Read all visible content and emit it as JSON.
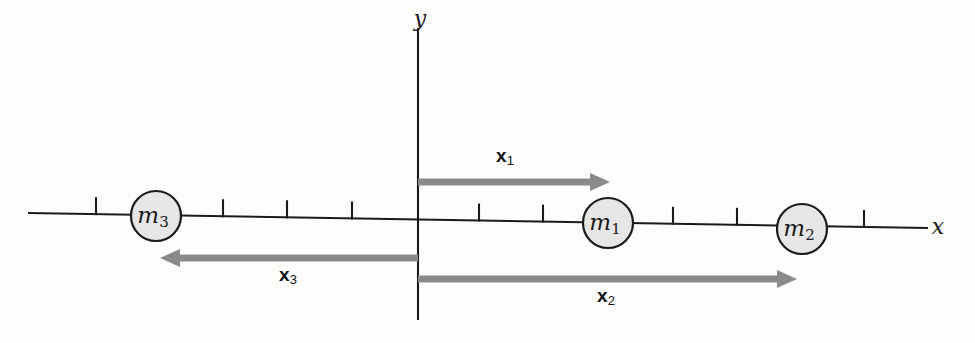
{
  "figure": {
    "background_color": "#fdfdfc",
    "axis_color": "#1a1a1a",
    "vector_color": "#8a8a8a",
    "mass_fill_color": "#e6e6e6"
  },
  "chart_data": {
    "type": "scatter",
    "title": "",
    "xlabel": "x",
    "ylabel": "y",
    "grid": false,
    "legend": null,
    "axes": {
      "x_axis": {
        "label": "x",
        "label_position": {
          "x": 938,
          "y": 228
        },
        "start": {
          "x": 28,
          "y": 213
        },
        "end": {
          "x": 928,
          "y": 228
        },
        "tick_spacing_px": 64,
        "tick_length_px": 17,
        "tick_positions_px": [
          96,
          223,
          287,
          352,
          479,
          543,
          673,
          737,
          864
        ]
      },
      "y_axis": {
        "label": "y",
        "label_position": {
          "x": 420,
          "y": 20
        },
        "start": {
          "x": 418,
          "y": 28
        },
        "end": {
          "x": 418,
          "y": 320
        }
      },
      "origin": {
        "x": 418,
        "y": 222
      }
    },
    "masses": [
      {
        "name": "m1",
        "symbol": "m",
        "subscript": "1",
        "center": {
          "x": 608,
          "y": 223
        },
        "radius": 25,
        "axis_units_from_origin": 3
      },
      {
        "name": "m2",
        "symbol": "m",
        "subscript": "2",
        "center": {
          "x": 802,
          "y": 229
        },
        "radius": 25,
        "axis_units_from_origin": 6
      },
      {
        "name": "m3",
        "symbol": "m",
        "subscript": "3",
        "center": {
          "x": 156,
          "y": 216
        },
        "radius": 25,
        "axis_units_from_origin": -4
      }
    ],
    "vectors": [
      {
        "name": "x1",
        "symbol": "x",
        "subscript": "1",
        "direction": "right",
        "tail": {
          "x": 418,
          "y": 182
        },
        "tip": {
          "x": 610,
          "y": 182
        },
        "length_px": 192,
        "label_position": {
          "x": 505,
          "y": 157
        },
        "points_to_mass": "m1"
      },
      {
        "name": "x2",
        "symbol": "x",
        "subscript": "2",
        "direction": "right",
        "tail": {
          "x": 418,
          "y": 279
        },
        "tip": {
          "x": 797,
          "y": 279
        },
        "length_px": 379,
        "label_position": {
          "x": 606,
          "y": 297
        },
        "points_to_mass": "m2"
      },
      {
        "name": "x3",
        "symbol": "x",
        "subscript": "3",
        "direction": "left",
        "tail": {
          "x": 418,
          "y": 258
        },
        "tip": {
          "x": 160,
          "y": 258
        },
        "length_px": 258,
        "label_position": {
          "x": 288,
          "y": 276
        },
        "points_to_mass": "m3"
      }
    ],
    "arrowhead": {
      "length_px": 20,
      "half_width_px": 9,
      "shaft_width_px": 7
    }
  }
}
